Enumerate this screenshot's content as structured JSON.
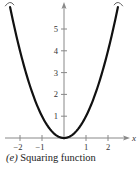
{
  "chart_data": {
    "type": "line",
    "title": "(e) Squaring function",
    "function": "f(x) = x^2",
    "xlabel": "x",
    "ylabel": "",
    "xlim": [
      -2.6,
      2.9
    ],
    "ylim": [
      0,
      6.2
    ],
    "x_ticks": [
      -2,
      -1,
      1,
      2
    ],
    "x_tick_labels": [
      "−2",
      "−1",
      "1",
      "2"
    ],
    "y_ticks": [
      1,
      2,
      3,
      4,
      5
    ],
    "y_tick_labels": [
      "1",
      "2",
      "3",
      "4",
      "5"
    ],
    "grid": false,
    "legend": null,
    "series": [
      {
        "name": "x^2",
        "x": [
          -2.45,
          -2,
          -1.5,
          -1,
          -0.5,
          0,
          0.5,
          1,
          1.5,
          2,
          2.45
        ],
        "values": [
          6.0,
          4,
          2.25,
          1,
          0.25,
          0,
          0.25,
          1,
          2.25,
          4,
          6.0
        ]
      }
    ]
  },
  "caption": {
    "label": "(e)",
    "text": "Squaring function"
  },
  "colors": {
    "curve": "#111111",
    "axis": "#888888",
    "text": "#333333"
  }
}
